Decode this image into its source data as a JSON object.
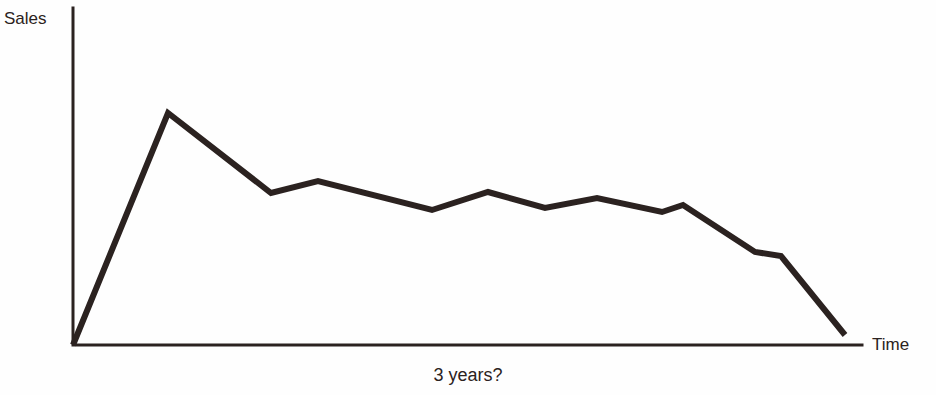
{
  "chart_data": {
    "type": "line",
    "title": "",
    "subtitle": "",
    "xlabel": "Time",
    "ylabel": "Sales",
    "caption": "3 years?",
    "grid": false,
    "legend": false,
    "axis_style": "two-axis-corner",
    "line_color": "#2b2220",
    "axis_color": "#2b2220",
    "background_color": "#fefefe",
    "line_width": 6,
    "axis_width": 3,
    "xlim": [
      0,
      100
    ],
    "ylim": [
      0,
      100
    ],
    "annotations": [
      {
        "text": "3 years?",
        "position": "below-x-axis-center"
      }
    ],
    "series": [
      {
        "name": "Sales",
        "description": "Product life-cycle curve: sharp launch rise to peak, sawtooth decline, final collapse to zero",
        "x": [
          0,
          12.3,
          25.7,
          31.8,
          46.6,
          52.5,
          59.8,
          66.3,
          74.4,
          76.5,
          86.4,
          89.7,
          100.0
        ],
        "y": [
          0,
          98.7,
          64.5,
          69.7,
          57.1,
          62.5,
          55.6,
          59.0,
          54.9,
          57.0,
          39.4,
          38.2,
          4.3
        ],
        "points_px": [
          {
            "x": 73,
            "y": 345
          },
          {
            "x": 168,
            "y": 113
          },
          {
            "x": 271,
            "y": 193
          },
          {
            "x": 318,
            "y": 181
          },
          {
            "x": 432,
            "y": 210
          },
          {
            "x": 488,
            "y": 192
          },
          {
            "x": 545,
            "y": 208
          },
          {
            "x": 597,
            "y": 198
          },
          {
            "x": 662,
            "y": 212
          },
          {
            "x": 683,
            "y": 205
          },
          {
            "x": 755,
            "y": 252
          },
          {
            "x": 781,
            "y": 256
          },
          {
            "x": 845,
            "y": 335
          }
        ]
      }
    ],
    "axes_px": {
      "origin": {
        "x": 73,
        "y": 345
      },
      "y_axis_top": {
        "x": 73,
        "y": 8
      },
      "x_axis_right": {
        "x": 862,
        "y": 345
      }
    }
  }
}
